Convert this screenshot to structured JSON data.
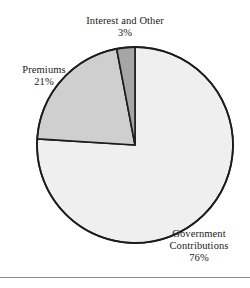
{
  "chart_data": {
    "type": "pie",
    "title": "",
    "subtitle": "",
    "xlabel": "",
    "ylabel": "",
    "legend_position": "none",
    "grid": false,
    "start_angle_deg": 90,
    "direction": "counterclockwise",
    "categories": [
      "Government Contributions",
      "Premiums",
      "Interest and Other"
    ],
    "values": [
      76,
      21,
      3
    ],
    "value_unit": "%",
    "value_labels": [
      "76%",
      "21%",
      "3%"
    ],
    "slices": [
      {
        "label": "Government Contributions",
        "value": 76,
        "value_label": "76%",
        "color": "#EFEFEF",
        "label_lines": [
          "Government",
          "Contributions",
          "76%"
        ]
      },
      {
        "label": "Premiums",
        "value": 21,
        "value_label": "21%",
        "color": "#CFCFCF",
        "label_lines": [
          "Premiums",
          "21%"
        ]
      },
      {
        "label": "Interest and Other",
        "value": 3,
        "value_label": "3%",
        "color": "#A6A6A6",
        "label_lines": [
          "Interest and Other",
          "3%"
        ]
      }
    ]
  },
  "labels": {
    "interest": {
      "name": "Interest and Other",
      "value": "3%"
    },
    "premiums": {
      "name": "Premiums",
      "value": "21%"
    },
    "government": {
      "name_line1": "Government",
      "name_line2": "Contributions",
      "value": "76%"
    }
  },
  "colors": {
    "government_slice": "#EFEFEF",
    "premiums_slice": "#CFCFCF",
    "interest_slice": "#A6A6A6",
    "outline": "#1C1C1C",
    "text": "#1A1A1A",
    "rule": "#8E8E8E",
    "background": "#FFFFFF"
  },
  "geometry": {
    "center_x": 135,
    "center_y": 145,
    "radius": 98
  }
}
